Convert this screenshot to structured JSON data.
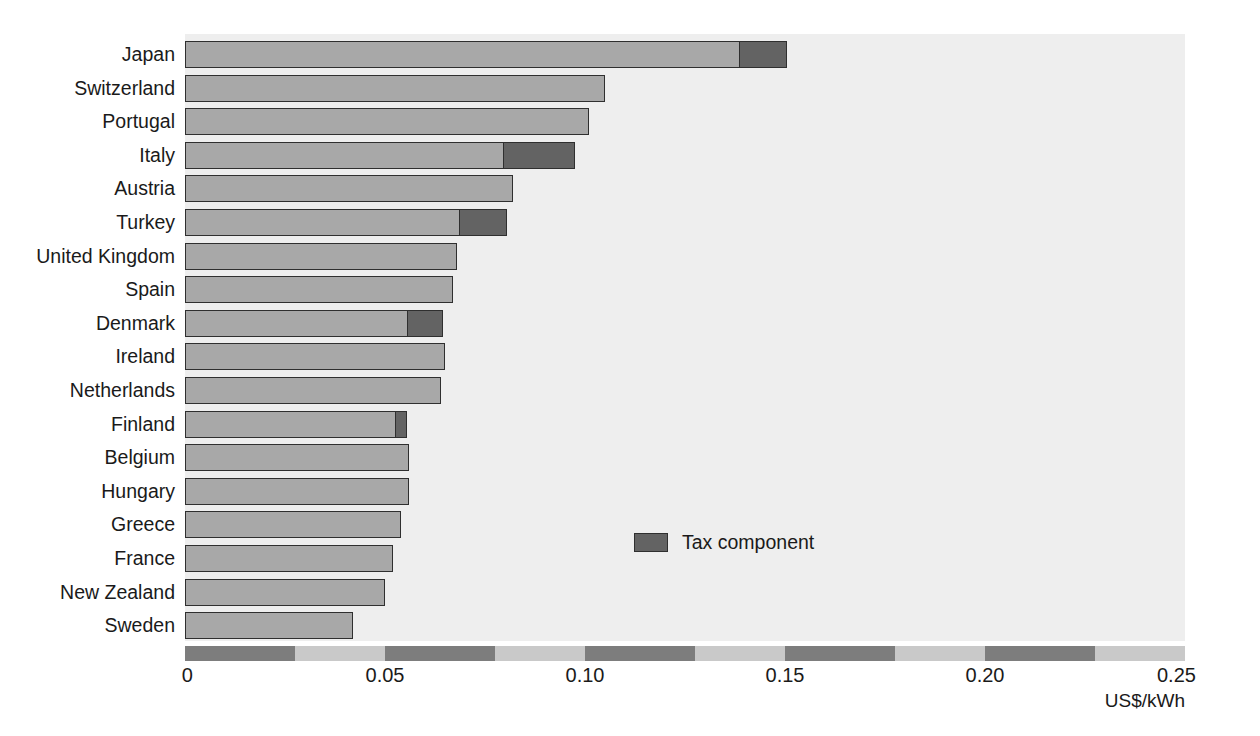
{
  "chart_data": {
    "type": "bar",
    "orientation": "horizontal",
    "title": "",
    "subtitle": "",
    "xlabel": "US$/kWh",
    "ylabel": "",
    "xlim": [
      0,
      0.25
    ],
    "xticks": [
      "0",
      "0.05",
      "0.10",
      "0.15",
      "0.20",
      "0.25"
    ],
    "xtick_values": [
      0,
      0.05,
      0.1,
      0.15,
      0.2,
      0.25
    ],
    "grid": false,
    "legend": {
      "position": "inside-center-right",
      "entries": [
        {
          "label": "Tax component",
          "color": "#636363"
        }
      ]
    },
    "stacked": true,
    "categories": [
      "Japan",
      "Switzerland",
      "Portugal",
      "Italy",
      "Austria",
      "Turkey",
      "United Kingdom",
      "Spain",
      "Denmark",
      "Ireland",
      "Netherlands",
      "Finland",
      "Belgium",
      "Hungary",
      "Greece",
      "France",
      "New Zealand",
      "Sweden"
    ],
    "series": [
      {
        "name": "Pre-tax price",
        "color": "#a8a8a8",
        "values": [
          0.139,
          0.105,
          0.101,
          0.08,
          0.082,
          0.069,
          0.068,
          0.067,
          0.056,
          0.065,
          0.064,
          0.053,
          0.056,
          0.056,
          0.054,
          0.052,
          0.05,
          0.042
        ]
      },
      {
        "name": "Tax component",
        "color": "#636363",
        "values": [
          0.012,
          0.0,
          0.0,
          0.018,
          0.0,
          0.012,
          0.0,
          0.0,
          0.009,
          0.0,
          0.0,
          0.003,
          0.0,
          0.0,
          0.0,
          0.0,
          0.0,
          0.0
        ]
      }
    ],
    "totals": [
      0.151,
      0.105,
      0.101,
      0.098,
      0.082,
      0.081,
      0.068,
      0.067,
      0.066,
      0.065,
      0.064,
      0.056,
      0.056,
      0.056,
      0.054,
      0.052,
      0.05,
      0.042
    ]
  },
  "axis": {
    "units_label": "US$/kWh"
  },
  "legend": {
    "tax_label": "Tax component"
  },
  "bleed_text": {
    "heading": "REGULATORY REFORM IN THE UNITED KINGDOM",
    "line_a": "for institutions, it is",
    "line_b": "deliver their services",
    "line_c": "in the provision of",
    "line_d": "and service delivery",
    "line_e": "by reference to these",
    "line_f": "Figure 1. Domestic electricity prices",
    "line_g": "3. The",
    "line_h": "energy"
  }
}
